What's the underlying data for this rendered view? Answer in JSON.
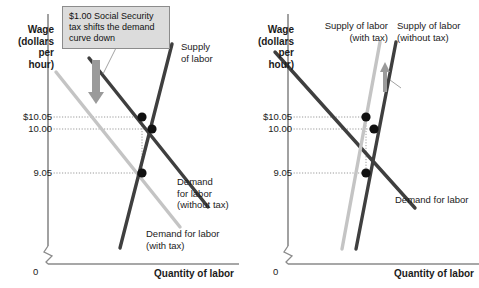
{
  "figure": {
    "type": "economics-supply-demand-tax-incidence",
    "panels": [
      {
        "id": "left",
        "y_axis_title": "Wage\n(dollars\nper\nhour)",
        "x_axis_title": "Quantity of labor",
        "origin_label": "0",
        "y_ticks": [
          "$10.05",
          "10.00",
          "9.05"
        ],
        "callout": "$1.00 Social Security\ntax shifts the demand\ncurve down",
        "labels": {
          "supply": "Supply\nof labor",
          "demand_without_tax": "Demand\nfor labor\n(without tax)",
          "demand_with_tax": "Demand for labor\n(with tax)"
        },
        "shift_arrow_direction": "down"
      },
      {
        "id": "right",
        "y_axis_title": "Wage\n(dollars\nper\nhour)",
        "x_axis_title": "Quantity of labor",
        "origin_label": "0",
        "y_ticks": [
          "$10.05",
          "10.00",
          "9.05"
        ],
        "callout": "$1.00 Social\nSecurity tax\nshifts the supply\ncurve up",
        "labels": {
          "supply_with_tax": "Supply of labor\n(with tax)",
          "supply_without_tax": "Supply of labor\n(without tax)",
          "demand": "Demand for labor"
        },
        "shift_arrow_direction": "up"
      }
    ],
    "colors": {
      "dark_curve": "#3f3f3f",
      "light_curve": "#c4c4c4",
      "axis": "#8a8a8a",
      "dot": "#111111",
      "callout_fill": "#dcdcdc",
      "callout_border": "#8c8c8c",
      "arrow": "#9a9a9a",
      "guide_line": "#9a9a9a"
    }
  }
}
